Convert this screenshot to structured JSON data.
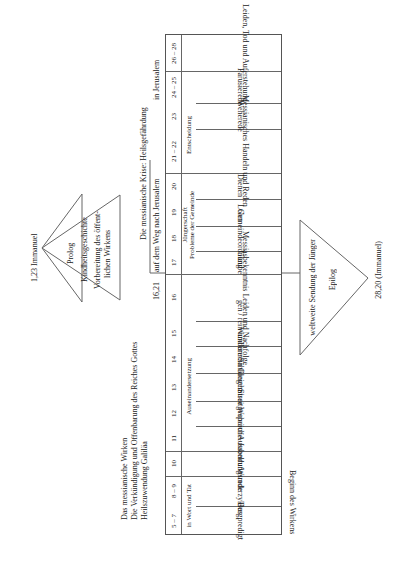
{
  "prolog": {
    "start_ref": "1,23 Immanuel",
    "title": "Prolog",
    "line1": "Kindheitsgeschichte",
    "line2": "Vorbereitung des öffent-",
    "line3": "lichen Wirkens"
  },
  "epilog": {
    "end_ref": "28,20 (Immanuel)",
    "title": "Epilog",
    "line1": "weltweite Sendung der Jünger"
  },
  "main_heading": {
    "line1": "Das messianische Wirken",
    "line2": "Die Verkündigung und Offenbarung des Reiches Gottes",
    "line3": "Heilszuwendung Galiläa"
  },
  "crisis_heading": {
    "line1": "Die messianische Krise: Heilsgefährdung",
    "line2a": "auf dem Weg nach Jerusalem",
    "line2b": "in Jerusalem",
    "ref": "16,21"
  },
  "beginning_label": "Beginn des Wirkens",
  "groups": [
    {
      "label": "in Wort und Tat"
    },
    {
      "label": "Auseinandersetzung"
    },
    {
      "label": "Jüngerschaft"
    },
    {
      "label": "Probleme der Gemeinde"
    },
    {
      "label": "Entscheidung"
    }
  ],
  "rows": [
    {
      "chapters": "26 – 28",
      "content": "Leiden, Tod und Auferstehung"
    },
    {
      "chapters": "24 – 25",
      "content": "Parusierede"
    },
    {
      "chapters": "23",
      "content": "Weherede"
    },
    {
      "chapters": "21 – 22",
      "content": "Messianisches Handeln und Reden"
    },
    {
      "chapters": "20",
      "content": "Dienen"
    },
    {
      "chapters": "19",
      "content": "Lohn"
    },
    {
      "chapters": "18",
      "content": "Gemeindeordnung"
    },
    {
      "chapters": "17",
      "content": "Glaube"
    },
    {
      "chapters": "16",
      "content": "Messiasbekenntnis Leiden und Nachfolge"
    },
    {
      "chapters": "15",
      "content": "gen / rein und unrein"
    },
    {
      "chapters": "14",
      "content": "Wundererzählungen"
    },
    {
      "chapters": "13",
      "content": "Gleichnisse"
    },
    {
      "chapters": "12",
      "content": "Streitgespräche"
    },
    {
      "chapters": "11",
      "content": "Weheruf + Jubelruf"
    },
    {
      "chapters": "10",
      "content": "Aussendungsrede"
    },
    {
      "chapters": "8 – 9",
      "content": "Wunderzyklus"
    },
    {
      "chapters": "5 – 7",
      "content": "Bergpredigt"
    }
  ]
}
